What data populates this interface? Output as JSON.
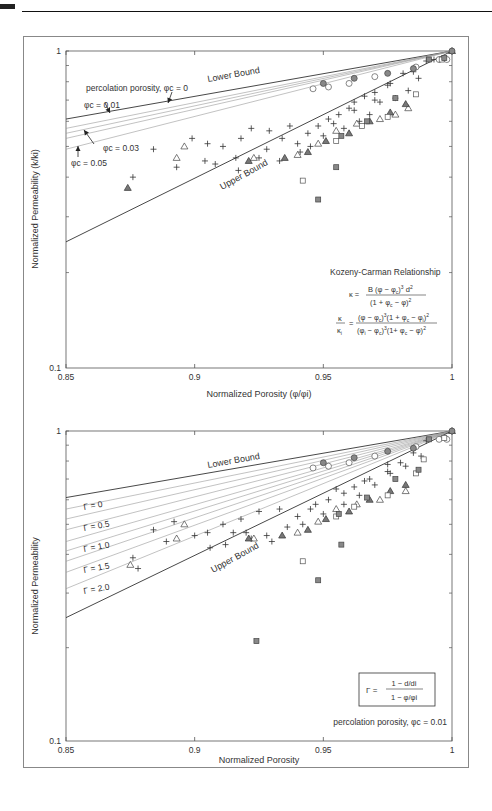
{
  "chart_data": [
    {
      "type": "scatter",
      "title": "",
      "xlabel": "Normalized Porosity (φ/φi)",
      "ylabel": "Normalized Permeability (k/ki)",
      "xlim": [
        0.85,
        1
      ],
      "ylim": [
        0.1,
        1
      ],
      "yscale": "log",
      "x_ticks": [
        "0.85",
        "0.9",
        "0.95",
        "1"
      ],
      "y_ticks": [
        "0.1",
        "1"
      ],
      "grid": false,
      "annotations": {
        "lower_bound": "Lower Bound",
        "upper_bound": "Upper Bound",
        "percolation_label": "percolation porosity, φc = 0",
        "phic_001": "φc = 0.01",
        "phic_003": "φc = 0.03",
        "phic_005": "φc = 0.05",
        "equation_title": "Kozeny-Carman Relationship",
        "equation_1": "κ = B (φ − φc)³ d² / (1 + φc − φ)²",
        "equation_2": "κ/κi = (φ − φc)³(1 + φc − φi)² / (φi − φc)³(1 + φc − φ)²"
      },
      "lines": [
        {
          "name": "Lower Bound (φc = 0)",
          "x": [
            0.85,
            1
          ],
          "y": [
            0.61,
            1
          ]
        },
        {
          "name": "φc = 0.01",
          "x": [
            0.85,
            1
          ],
          "y": [
            0.57,
            1
          ]
        },
        {
          "name": "φc = 0.02",
          "x": [
            0.85,
            1
          ],
          "y": [
            0.55,
            1
          ]
        },
        {
          "name": "φc = 0.03",
          "x": [
            0.85,
            1
          ],
          "y": [
            0.53,
            1
          ]
        },
        {
          "name": "φc = 0.05",
          "x": [
            0.85,
            1
          ],
          "y": [
            0.49,
            1
          ]
        },
        {
          "name": "Upper Bound",
          "x": [
            0.85,
            1
          ],
          "y": [
            0.25,
            1
          ]
        }
      ],
      "series": [
        {
          "name": "plus",
          "marker": "+",
          "points": [
            [
              0.884,
              0.49
            ],
            [
              0.899,
              0.53
            ],
            [
              0.905,
              0.51
            ],
            [
              0.911,
              0.5
            ],
            [
              0.893,
              0.43
            ],
            [
              0.904,
              0.45
            ],
            [
              0.876,
              0.4
            ],
            [
              0.918,
              0.53
            ],
            [
              0.922,
              0.57
            ],
            [
              0.929,
              0.56
            ],
            [
              0.934,
              0.53
            ],
            [
              0.94,
              0.51
            ],
            [
              0.944,
              0.55
            ],
            [
              0.948,
              0.58
            ],
            [
              0.952,
              0.61
            ],
            [
              0.956,
              0.63
            ],
            [
              0.96,
              0.66
            ],
            [
              0.962,
              0.69
            ],
            [
              0.966,
              0.72
            ],
            [
              0.97,
              0.74
            ],
            [
              0.975,
              0.78
            ],
            [
              0.981,
              0.85
            ],
            [
              0.985,
              0.86
            ],
            [
              0.99,
              0.93
            ],
            [
              0.993,
              0.94
            ],
            [
              0.916,
              0.46
            ],
            [
              0.928,
              0.49
            ],
            [
              0.937,
              0.58
            ],
            [
              0.945,
              0.5
            ],
            [
              0.95,
              0.54
            ],
            [
              0.958,
              0.57
            ],
            [
              0.964,
              0.6
            ],
            [
              0.968,
              0.63
            ],
            [
              0.972,
              0.69
            ],
            [
              0.978,
              0.71
            ],
            [
              0.983,
              0.75
            ],
            [
              0.987,
              0.82
            ],
            [
              0.908,
              0.44
            ],
            [
              0.917,
              0.42
            ],
            [
              0.925,
              0.46
            ],
            [
              0.933,
              0.45
            ],
            [
              0.941,
              0.48
            ],
            [
              0.954,
              0.59
            ],
            [
              0.962,
              0.65
            ],
            [
              0.97,
              0.7
            ],
            [
              0.976,
              0.79
            ]
          ]
        },
        {
          "name": "open-triangle",
          "marker": "triangle-open",
          "points": [
            [
              0.896,
              0.5
            ],
            [
              0.893,
              0.46
            ],
            [
              0.923,
              0.46
            ],
            [
              0.94,
              0.47
            ],
            [
              0.948,
              0.51
            ],
            [
              0.955,
              0.56
            ],
            [
              0.963,
              0.59
            ],
            [
              0.972,
              0.61
            ],
            [
              0.978,
              0.63
            ],
            [
              0.983,
              0.66
            ]
          ]
        },
        {
          "name": "filled-triangle",
          "marker": "triangle-filled",
          "points": [
            [
              0.874,
              0.37
            ],
            [
              0.921,
              0.45
            ],
            [
              0.935,
              0.46
            ],
            [
              0.944,
              0.48
            ],
            [
              0.951,
              0.52
            ],
            [
              0.96,
              0.55
            ],
            [
              0.968,
              0.6
            ],
            [
              0.976,
              0.64
            ],
            [
              0.982,
              0.68
            ],
            [
              1,
              1
            ]
          ]
        },
        {
          "name": "open-circle",
          "marker": "circle-open",
          "points": [
            [
              0.946,
              0.76
            ],
            [
              0.952,
              0.77
            ],
            [
              0.96,
              0.79
            ],
            [
              0.97,
              0.83
            ],
            [
              0.986,
              0.89
            ],
            [
              0.995,
              0.94
            ],
            [
              0.998,
              0.94
            ]
          ]
        },
        {
          "name": "filled-circle",
          "marker": "circle-filled",
          "points": [
            [
              0.95,
              0.79
            ],
            [
              0.962,
              0.82
            ],
            [
              0.975,
              0.85
            ],
            [
              0.985,
              0.88
            ],
            [
              1,
              1
            ]
          ]
        },
        {
          "name": "open-square",
          "marker": "square-open",
          "points": [
            [
              0.942,
              0.39
            ],
            [
              0.955,
              0.52
            ],
            [
              0.965,
              0.58
            ],
            [
              0.975,
              0.62
            ],
            [
              0.986,
              0.73
            ],
            [
              0.996,
              0.94
            ]
          ]
        },
        {
          "name": "filled-square",
          "marker": "square-filled",
          "points": [
            [
              0.948,
              0.34
            ],
            [
              0.955,
              0.43
            ],
            [
              0.957,
              0.54
            ],
            [
              0.967,
              0.6
            ],
            [
              0.978,
              0.71
            ],
            [
              0.991,
              0.94
            ],
            [
              0.997,
              0.95
            ]
          ]
        }
      ]
    },
    {
      "type": "scatter",
      "title": "",
      "xlabel": "Normalized Porosity",
      "ylabel": "Normalized Permeability",
      "xlim": [
        0.85,
        1
      ],
      "ylim": [
        0.1,
        1
      ],
      "yscale": "log",
      "x_ticks": [
        "0.85",
        "0.9",
        "0.95",
        "1"
      ],
      "y_ticks": [
        "0.1",
        "1"
      ],
      "grid": false,
      "annotations": {
        "lower_bound": "Lower Bound",
        "upper_bound": "Upper Bound",
        "gamma_0": "Γ = 0",
        "gamma_05": "Γ = 0.5",
        "gamma_10": "Γ = 1.0",
        "gamma_15": "Γ = 1.5",
        "gamma_20": "Γ = 2.0",
        "gamma_def_num": "1 − d/di",
        "gamma_def_den": "1 − φ/φi",
        "gamma_def_lhs": "Γ =",
        "percolation_label": "percolation porosity, φc = 0.01"
      },
      "lines": [
        {
          "name": "Lower Bound",
          "x": [
            0.85,
            1
          ],
          "y": [
            0.61,
            1
          ]
        },
        {
          "name": "Γ = 0",
          "x": [
            0.85,
            1
          ],
          "y": [
            0.56,
            1
          ]
        },
        {
          "name": "Γ = 0.25",
          "x": [
            0.85,
            1
          ],
          "y": [
            0.52,
            1
          ]
        },
        {
          "name": "Γ = 0.5",
          "x": [
            0.85,
            1
          ],
          "y": [
            0.48,
            1
          ]
        },
        {
          "name": "Γ = 0.75",
          "x": [
            0.85,
            1
          ],
          "y": [
            0.44,
            1
          ]
        },
        {
          "name": "Γ = 1.0",
          "x": [
            0.85,
            1
          ],
          "y": [
            0.41,
            1
          ]
        },
        {
          "name": "Γ = 1.25",
          "x": [
            0.85,
            1
          ],
          "y": [
            0.38,
            1
          ]
        },
        {
          "name": "Γ = 1.5",
          "x": [
            0.85,
            1
          ],
          "y": [
            0.35,
            1
          ]
        },
        {
          "name": "Γ = 2.0",
          "x": [
            0.85,
            1
          ],
          "y": [
            0.31,
            1
          ]
        },
        {
          "name": "Upper Bound",
          "x": [
            0.85,
            1
          ],
          "y": [
            0.25,
            1
          ]
        }
      ],
      "series": [
        {
          "name": "plus",
          "marker": "+",
          "points": [
            [
              0.884,
              0.48
            ],
            [
              0.892,
              0.51
            ],
            [
              0.9,
              0.46
            ],
            [
              0.905,
              0.47
            ],
            [
              0.906,
              0.42
            ],
            [
              0.911,
              0.5
            ],
            [
              0.92,
              0.47
            ],
            [
              0.876,
              0.39
            ],
            [
              0.889,
              0.44
            ],
            [
              0.878,
              0.36
            ],
            [
              0.918,
              0.52
            ],
            [
              0.925,
              0.55
            ],
            [
              0.933,
              0.56
            ],
            [
              0.94,
              0.53
            ],
            [
              0.947,
              0.58
            ],
            [
              0.952,
              0.6
            ],
            [
              0.958,
              0.63
            ],
            [
              0.962,
              0.66
            ],
            [
              0.968,
              0.7
            ],
            [
              0.975,
              0.74
            ],
            [
              0.98,
              0.79
            ],
            [
              0.985,
              0.85
            ],
            [
              0.99,
              0.93
            ],
            [
              0.928,
              0.46
            ],
            [
              0.936,
              0.49
            ],
            [
              0.942,
              0.5
            ],
            [
              0.95,
              0.54
            ],
            [
              0.958,
              0.58
            ],
            [
              0.964,
              0.62
            ],
            [
              0.97,
              0.67
            ],
            [
              0.976,
              0.73
            ],
            [
              0.982,
              0.77
            ],
            [
              0.988,
              0.83
            ],
            [
              0.912,
              0.43
            ],
            [
              0.922,
              0.45
            ],
            [
              0.93,
              0.44
            ],
            [
              0.915,
              0.47
            ],
            [
              0.945,
              0.56
            ],
            [
              0.955,
              0.65
            ],
            [
              0.966,
              0.69
            ],
            [
              0.975,
              0.78
            ]
          ]
        },
        {
          "name": "open-triangle",
          "marker": "triangle-open",
          "points": [
            [
              0.896,
              0.5
            ],
            [
              0.893,
              0.45
            ],
            [
              0.875,
              0.37
            ],
            [
              0.923,
              0.45
            ],
            [
              0.94,
              0.47
            ],
            [
              0.948,
              0.51
            ],
            [
              0.955,
              0.56
            ],
            [
              0.963,
              0.58
            ],
            [
              0.972,
              0.6
            ],
            [
              0.982,
              0.64
            ]
          ]
        },
        {
          "name": "filled-triangle",
          "marker": "triangle-filled",
          "points": [
            [
              0.921,
              0.45
            ],
            [
              0.934,
              0.46
            ],
            [
              0.944,
              0.48
            ],
            [
              0.951,
              0.52
            ],
            [
              0.96,
              0.55
            ],
            [
              0.968,
              0.6
            ],
            [
              0.976,
              0.64
            ],
            [
              0.982,
              0.67
            ],
            [
              1,
              1
            ]
          ]
        },
        {
          "name": "open-circle",
          "marker": "circle-open",
          "points": [
            [
              0.946,
              0.76
            ],
            [
              0.952,
              0.77
            ],
            [
              0.96,
              0.79
            ],
            [
              0.97,
              0.83
            ],
            [
              0.986,
              0.89
            ],
            [
              0.995,
              0.94
            ],
            [
              0.998,
              0.94
            ]
          ]
        },
        {
          "name": "filled-circle",
          "marker": "circle-filled",
          "points": [
            [
              0.95,
              0.79
            ],
            [
              0.962,
              0.82
            ],
            [
              0.975,
              0.86
            ],
            [
              0.985,
              0.88
            ],
            [
              1,
              1
            ]
          ]
        },
        {
          "name": "open-square",
          "marker": "square-open",
          "points": [
            [
              0.942,
              0.38
            ],
            [
              0.955,
              0.53
            ],
            [
              0.962,
              0.57
            ],
            [
              0.975,
              0.62
            ],
            [
              0.986,
              0.73
            ],
            [
              0.989,
              0.81
            ],
            [
              0.997,
              0.95
            ]
          ]
        },
        {
          "name": "filled-square",
          "marker": "square-filled",
          "points": [
            [
              0.948,
              0.33
            ],
            [
              0.924,
              0.21
            ],
            [
              0.957,
              0.43
            ],
            [
              0.956,
              0.54
            ],
            [
              0.967,
              0.61
            ],
            [
              0.978,
              0.7
            ],
            [
              0.987,
              0.75
            ],
            [
              0.991,
              0.94
            ]
          ]
        }
      ]
    }
  ]
}
